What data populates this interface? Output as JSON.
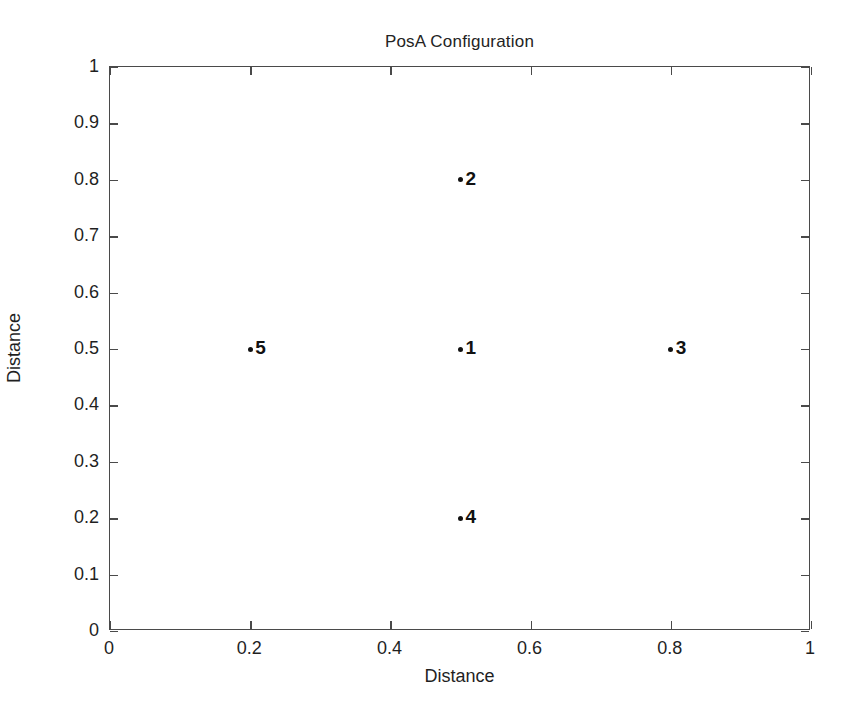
{
  "chart_data": {
    "type": "scatter",
    "title": "PosA Configuration",
    "xlabel": "Distance",
    "ylabel": "Distance",
    "xlim": [
      0,
      1
    ],
    "ylim": [
      0,
      1
    ],
    "grid": false,
    "legend": null,
    "xticks": [
      "0",
      "0.2",
      "0.4",
      "0.6",
      "0.8",
      "1"
    ],
    "xtick_values": [
      0,
      0.2,
      0.4,
      0.6,
      0.8,
      1
    ],
    "yticks": [
      "0",
      "0.1",
      "0.2",
      "0.3",
      "0.4",
      "0.5",
      "0.6",
      "0.7",
      "0.8",
      "0.9",
      "1"
    ],
    "ytick_values": [
      0,
      0.1,
      0.2,
      0.3,
      0.4,
      0.5,
      0.6,
      0.7,
      0.8,
      0.9,
      1
    ],
    "marker_color": "#111111",
    "axis_color": "#4a4a4a",
    "points": [
      {
        "label": "1",
        "x": 0.5,
        "y": 0.5
      },
      {
        "label": "2",
        "x": 0.5,
        "y": 0.8
      },
      {
        "label": "3",
        "x": 0.8,
        "y": 0.5
      },
      {
        "label": "4",
        "x": 0.5,
        "y": 0.2
      },
      {
        "label": "5",
        "x": 0.2,
        "y": 0.5
      }
    ]
  }
}
